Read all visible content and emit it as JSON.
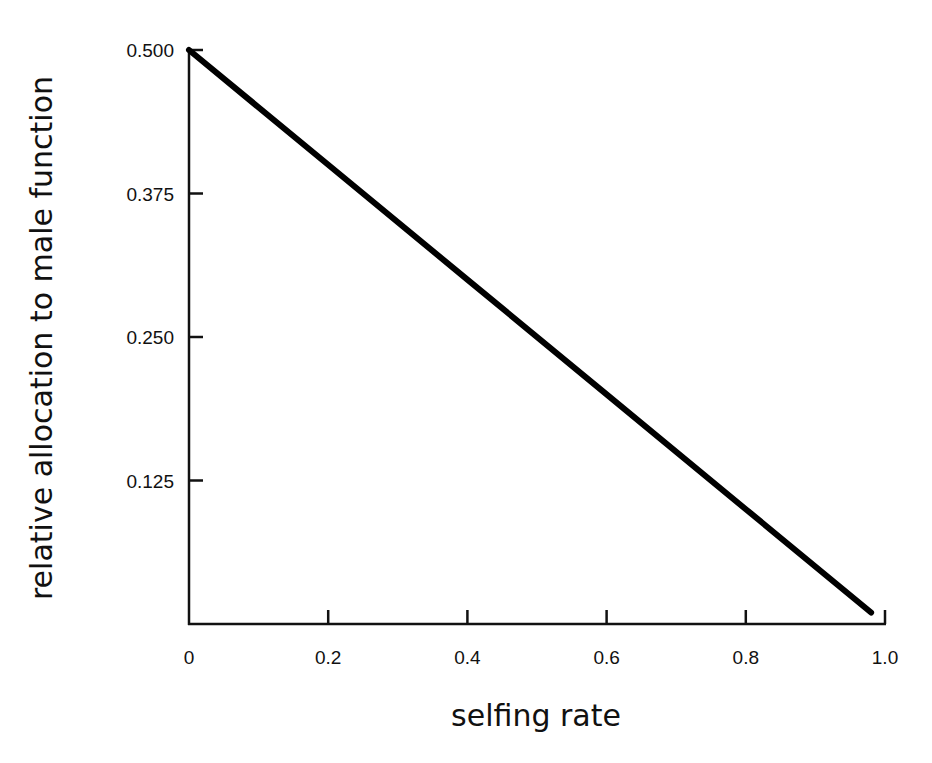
{
  "chart_data": {
    "type": "line",
    "title": "",
    "xlabel": "selfing rate",
    "ylabel": "relative allocation to male function",
    "xlim": [
      0,
      1.0
    ],
    "ylim": [
      0,
      0.5
    ],
    "x_ticks": [
      "0",
      "0.2",
      "0.4",
      "0.6",
      "0.8",
      "1.0"
    ],
    "x_tick_values": [
      0,
      0.2,
      0.4,
      0.6,
      0.8,
      1.0
    ],
    "y_ticks": [
      "0.500",
      "0.375",
      "0.250",
      "0.125"
    ],
    "y_tick_values": [
      0.5,
      0.375,
      0.25,
      0.125
    ],
    "grid": false,
    "legend": null,
    "series": [
      {
        "name": "male allocation",
        "x": [
          0,
          0.2,
          0.4,
          0.6,
          0.8,
          0.98
        ],
        "y": [
          0.5,
          0.4,
          0.3,
          0.2,
          0.1,
          0.01
        ],
        "color": "#000000"
      }
    ]
  },
  "colors": {
    "background": "#ffffff",
    "axis": "#111111",
    "line": "#000000"
  }
}
